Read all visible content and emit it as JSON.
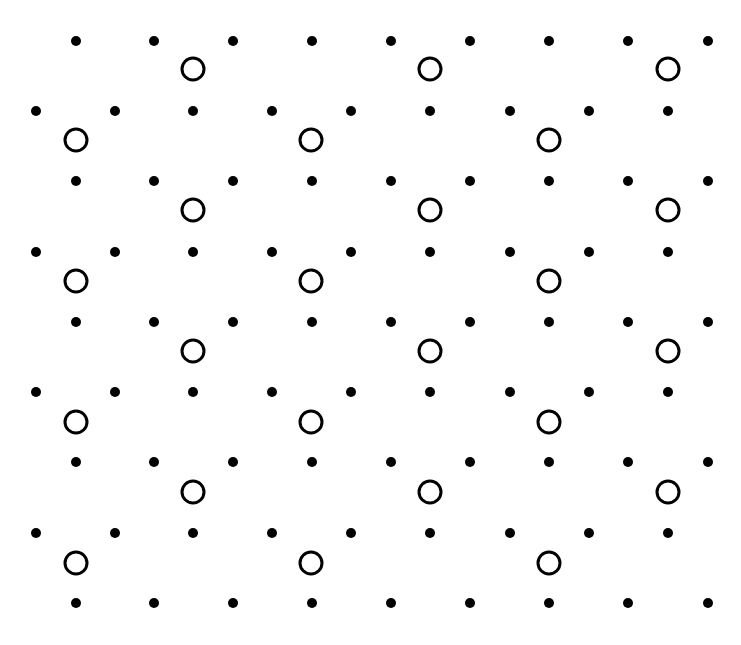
{
  "diagram": {
    "type": "lattice",
    "background": "#ffffff",
    "ink": "#000000",
    "dot_radius": 5,
    "circle_radius": 11,
    "circle_stroke": 3,
    "dot_rows": [
      {
        "y": 41,
        "xs": [
          76,
          154,
          233,
          312,
          391,
          470,
          549,
          628,
          708
        ]
      },
      {
        "y": 111,
        "xs": [
          36,
          115,
          193,
          272,
          351,
          430,
          510,
          589,
          668
        ]
      },
      {
        "y": 181,
        "xs": [
          76,
          154,
          233,
          312,
          391,
          470,
          549,
          628,
          708
        ]
      },
      {
        "y": 252,
        "xs": [
          36,
          115,
          193,
          272,
          351,
          430,
          510,
          589,
          668
        ]
      },
      {
        "y": 322,
        "xs": [
          76,
          154,
          233,
          312,
          391,
          470,
          549,
          628,
          708
        ]
      },
      {
        "y": 392,
        "xs": [
          36,
          115,
          193,
          272,
          351,
          430,
          510,
          589,
          668
        ]
      },
      {
        "y": 462,
        "xs": [
          76,
          154,
          233,
          312,
          391,
          470,
          549,
          628,
          708
        ]
      },
      {
        "y": 533,
        "xs": [
          36,
          115,
          193,
          272,
          351,
          430,
          510,
          589,
          668
        ]
      },
      {
        "y": 603,
        "xs": [
          76,
          154,
          233,
          312,
          391,
          470,
          549,
          628,
          708
        ]
      }
    ],
    "circle_rows": [
      {
        "y": 69,
        "xs": [
          193,
          430,
          668
        ]
      },
      {
        "y": 140,
        "xs": [
          76,
          311,
          549
        ]
      },
      {
        "y": 210,
        "xs": [
          193,
          430,
          668
        ]
      },
      {
        "y": 281,
        "xs": [
          76,
          311,
          549
        ]
      },
      {
        "y": 351,
        "xs": [
          193,
          430,
          668
        ]
      },
      {
        "y": 422,
        "xs": [
          76,
          311,
          549
        ]
      },
      {
        "y": 492,
        "xs": [
          193,
          430,
          668
        ]
      },
      {
        "y": 563,
        "xs": [
          76,
          311,
          549
        ]
      }
    ]
  }
}
